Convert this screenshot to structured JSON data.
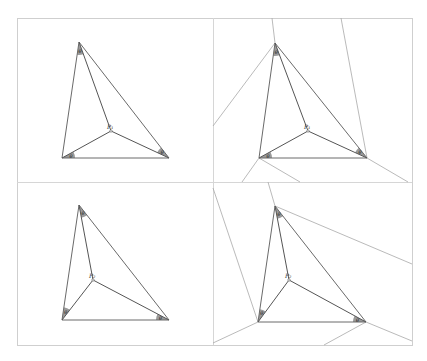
{
  "figure": {
    "panels": [
      {
        "id": "top-left",
        "point_label": "P₁",
        "angle_label": "θ",
        "vertices": {
          "A": [
            79,
            42
          ],
          "B": [
            62,
            158
          ],
          "C": [
            169,
            158
          ]
        },
        "point": [
          111,
          131
        ],
        "external_lines": []
      },
      {
        "id": "top-right",
        "point_label": "P₁",
        "angle_label": "θ",
        "vertices": {
          "A": [
            275,
            43
          ],
          "B": [
            259,
            158
          ],
          "C": [
            367,
            158
          ]
        },
        "point": [
          308,
          131
        ],
        "external_lines": [
          [
            [
              275,
              43
            ],
            [
              272,
              18
            ]
          ],
          [
            [
              275,
              43
            ],
            [
              213,
              126
            ]
          ],
          [
            [
              341,
              18
            ],
            [
              367,
              158
            ]
          ],
          [
            [
              367,
              158
            ],
            [
              408,
              182
            ]
          ],
          [
            [
              259,
              158
            ],
            [
              242,
              182
            ]
          ],
          [
            [
              259,
              158
            ],
            [
              300,
              182
            ]
          ]
        ]
      },
      {
        "id": "bottom-left",
        "point_label": "P₂",
        "angle_label": "θ",
        "vertices": {
          "A": [
            79,
            205
          ],
          "B": [
            62,
            320
          ],
          "C": [
            169,
            320
          ]
        },
        "point": [
          93,
          280
        ],
        "external_lines": []
      },
      {
        "id": "bottom-right",
        "point_label": "P₂",
        "angle_label": "θ",
        "vertices": {
          "A": [
            275,
            206
          ],
          "B": [
            258,
            322
          ],
          "C": [
            366,
            322
          ]
        },
        "point": [
          289,
          280
        ],
        "external_lines": [
          [
            [
              275,
              206
            ],
            [
              268,
              182
            ]
          ],
          [
            [
              275,
              206
            ],
            [
              412,
              264
            ]
          ],
          [
            [
              213,
              188
            ],
            [
              258,
              322
            ]
          ],
          [
            [
              258,
              322
            ],
            [
              213,
              343
            ]
          ],
          [
            [
              366,
              322
            ],
            [
              324,
              345
            ]
          ],
          [
            [
              366,
              322
            ],
            [
              412,
              341
            ]
          ]
        ]
      }
    ],
    "colors": {
      "frame": "#cfcfcf",
      "triangle": "#6a6a6a",
      "spoke": "#555555",
      "external": "#a8a8a8",
      "wedge": "#9a9a9a"
    }
  }
}
